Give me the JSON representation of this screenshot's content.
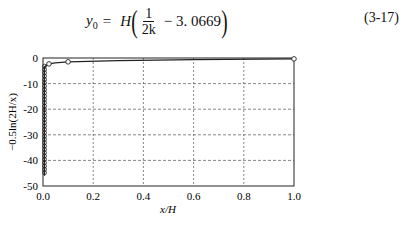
{
  "equation": {
    "lhs_symbol": "y",
    "lhs_subscript": "0",
    "equals": "=",
    "factor": "H",
    "frac_numerator": "1",
    "frac_denominator": "2k",
    "operator": "−",
    "constant": "3. 0669",
    "number": "(3-17)"
  },
  "chart_data": {
    "type": "line",
    "title": "",
    "xlabel": "x/H",
    "ylabel": "−0.5ln(2H/x)",
    "xlim": [
      0.0,
      1.0
    ],
    "ylim": [
      -50,
      0
    ],
    "xticks": [
      "0.0",
      "0.2",
      "0.4",
      "0.6",
      "0.8",
      "1.0"
    ],
    "yticks": [
      "0",
      "-10",
      "-20",
      "-30",
      "-40",
      "-50"
    ],
    "grid": true,
    "grid_style": "dashed",
    "legend": "none",
    "series": [
      {
        "name": "-0.5ln(2H/x)",
        "marker": "circle",
        "x": [
          1e-18,
          1e-16,
          1e-14,
          1e-12,
          1e-10,
          1e-08,
          1e-06,
          0.0001,
          0.001,
          0.003,
          0.01,
          0.03,
          0.1,
          1.0
        ],
        "y": [
          -20.9,
          -18.6,
          -16.3,
          -14.0,
          -11.7,
          -9.5,
          -7.2,
          -5.0,
          -3.8,
          -3.2,
          -2.6,
          -2.1,
          -1.5,
          -0.35
        ]
      }
    ],
    "annotations": [
      "Dense column of circle markers stacked at x≈0 from y≈-3 down to y≈-46"
    ]
  },
  "colors": {
    "line": "#222222",
    "grid": "#555555",
    "axis": "#222222"
  }
}
